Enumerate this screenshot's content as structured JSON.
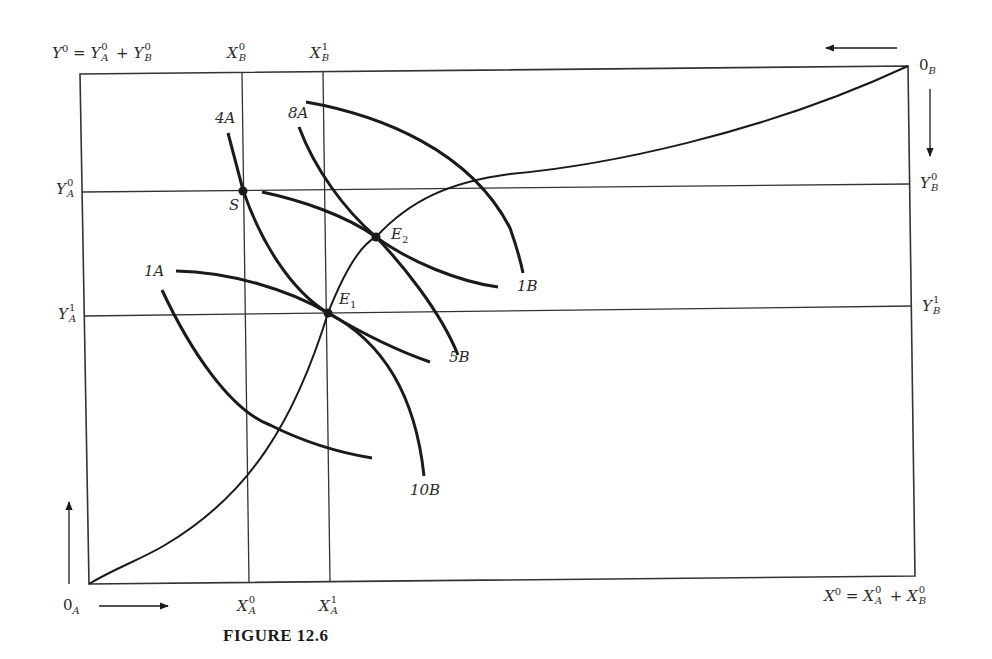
{
  "figure": {
    "caption": "FIGURE 12.6",
    "type": "Edgeworth box diagram"
  },
  "labels": {
    "top_left_total": {
      "base": "Y",
      "sup": "0",
      "eq": "=",
      "a": "Y",
      "a_sup": "0",
      "a_sub": "A",
      "plus": "+",
      "b": "Y",
      "b_sup": "0",
      "b_sub": "B"
    },
    "bottom_right_total": {
      "base": "X",
      "sup": "0",
      "eq": "=",
      "a": "X",
      "a_sup": "0",
      "a_sub": "A",
      "plus": "+",
      "b": "X",
      "b_sup": "0",
      "b_sub": "B"
    },
    "XB0": {
      "base": "X",
      "sup": "0",
      "sub": "B"
    },
    "XB1": {
      "base": "X",
      "sup": "1",
      "sub": "B"
    },
    "XA0": {
      "base": "X",
      "sup": "0",
      "sub": "A"
    },
    "XA1": {
      "base": "X",
      "sup": "1",
      "sub": "A"
    },
    "YA0": {
      "base": "Y",
      "sup": "0",
      "sub": "A"
    },
    "YA1": {
      "base": "Y",
      "sup": "1",
      "sub": "A"
    },
    "YB0": {
      "base": "Y",
      "sup": "0",
      "sub": "B"
    },
    "YB1": {
      "base": "Y",
      "sup": "1",
      "sub": "B"
    },
    "origin_A": {
      "base": "0",
      "sub": "A"
    },
    "origin_B": {
      "base": "0",
      "sub": "B"
    }
  },
  "points": [
    {
      "name": "S",
      "label": "S"
    },
    {
      "name": "E1",
      "label": "E",
      "sub": "1"
    },
    {
      "name": "E2",
      "label": "E",
      "sub": "2"
    }
  ],
  "indifference_curves": {
    "A": [
      {
        "label": "1A"
      },
      {
        "label": "4A"
      },
      {
        "label": "8A"
      }
    ],
    "B": [
      {
        "label": "1B"
      },
      {
        "label": "5B"
      },
      {
        "label": "10B"
      }
    ]
  },
  "arrows": {
    "origin_A": [
      "up",
      "right"
    ],
    "origin_B": [
      "left",
      "down"
    ]
  },
  "colors": {
    "ink": "#1a1a1a",
    "thin_line": "#333333",
    "background": "#ffffff"
  }
}
